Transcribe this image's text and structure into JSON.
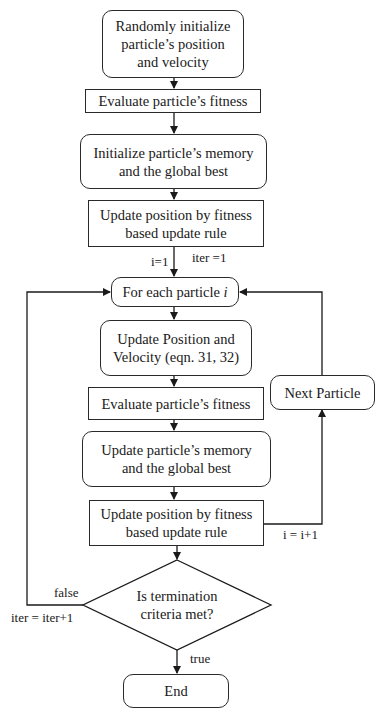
{
  "flowchart": {
    "nodes": {
      "init": {
        "line1": "Randomly initialize",
        "line2": "particle’s position",
        "line3": "and velocity"
      },
      "evaluate1": {
        "text": "Evaluate particle’s fitness"
      },
      "init_memory": {
        "line1": "Initialize particle’s memory",
        "line2": "and the global best"
      },
      "update_fitness1": {
        "line1": "Update position by fitness",
        "line2": "based update rule"
      },
      "for_each": {
        "text": "For each particle",
        "var": "i"
      },
      "update_pos_vel": {
        "line1": "Update Position and",
        "line2": "Velocity (eqn. 31, 32)"
      },
      "evaluate2": {
        "text": "Evaluate particle’s fitness"
      },
      "update_memory": {
        "line1": "Update particle’s memory",
        "line2": "and the global best"
      },
      "update_fitness2": {
        "line1": "Update position by fitness",
        "line2": "based update rule"
      },
      "next_particle": {
        "text": "Next Particle"
      },
      "decision": {
        "line1": "Is termination",
        "line2": "criteria met?"
      },
      "end": {
        "text": "End"
      }
    },
    "edge_labels": {
      "i_init": "i=1",
      "iter_init": "iter =1",
      "i_increment": "i = i+1",
      "false": "false",
      "iter_increment": "iter = iter+1",
      "true": "true"
    }
  }
}
